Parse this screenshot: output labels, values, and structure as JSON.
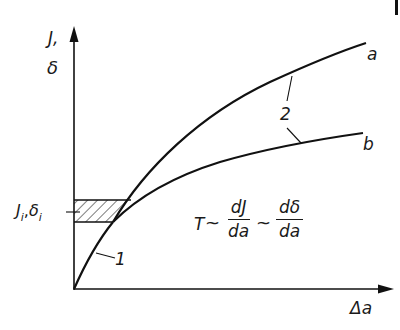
{
  "diagram": {
    "y_axis_label_line1": "J,",
    "y_axis_label_line2": "δ",
    "x_axis_label": "Δa",
    "initiation_label_J": "J",
    "initiation_label_J_sub": "i",
    "initiation_label_sep": ",",
    "initiation_label_delta": "δ",
    "initiation_label_delta_sub": "i",
    "curve_labels": {
      "upper": "a",
      "lower": "b",
      "blunting": "1",
      "tearing": "2"
    },
    "formula": {
      "lhs": "T",
      "tilde1": "~",
      "frac1_num": "dJ",
      "frac1_den": "da",
      "tilde2": "~",
      "frac2_num": "dδ",
      "frac2_den": "da"
    },
    "colors": {
      "ink": "#111111",
      "background": "#ffffff"
    }
  }
}
